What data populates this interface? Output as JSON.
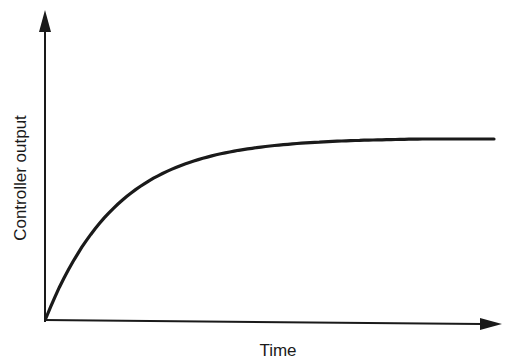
{
  "chart_data": {
    "type": "line",
    "title": "",
    "xlabel": "Time",
    "ylabel": "Controller output",
    "grid": false,
    "legend": null,
    "ticks": {
      "x": [],
      "y": []
    },
    "series": [
      {
        "name": "Controller output",
        "x": [
          0,
          0.05,
          0.1,
          0.2,
          0.3,
          0.4,
          0.5,
          0.6,
          0.7,
          0.8,
          0.9,
          1.0
        ],
        "y": [
          0,
          0.3,
          0.52,
          0.78,
          0.9,
          0.96,
          0.985,
          0.995,
          1.0,
          1.0,
          1.0,
          1.0
        ]
      }
    ],
    "xlim": [
      0,
      1.05
    ],
    "ylim": [
      0,
      1.7
    ]
  },
  "colors": {
    "line": "#1a1a1a",
    "background": "#ffffff"
  }
}
